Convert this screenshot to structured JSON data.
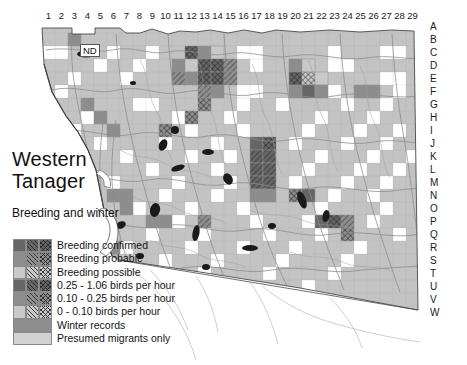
{
  "map": {
    "title_line1": "Western",
    "title_line2": "Tanager",
    "subtitle": "Breeding and winter",
    "nd_label": "ND",
    "region": "San Diego County atlas grid",
    "colors": {
      "land": "#c3c3c3",
      "ocean": "#ffffff",
      "border": "#555555",
      "road": "#9a9a9a",
      "water": "#111111",
      "grid": "#9e9e9e",
      "dark": "#666666",
      "mid": "#8e8e8e",
      "light": "#c9c9c9",
      "white": "#ffffff"
    },
    "columns": [
      "1",
      "2",
      "3",
      "4",
      "5",
      "6",
      "7",
      "8",
      "9",
      "10",
      "11",
      "12",
      "13",
      "14",
      "15",
      "16",
      "17",
      "18",
      "19",
      "20",
      "21",
      "22",
      "23",
      "24",
      "25",
      "26",
      "27",
      "28",
      "29"
    ],
    "rows": [
      "A",
      "B",
      "C",
      "D",
      "E",
      "F",
      "G",
      "H",
      "I",
      "J",
      "K",
      "L",
      "M",
      "N",
      "O",
      "P",
      "Q",
      "R",
      "S",
      "T",
      "U",
      "V",
      "W"
    ]
  },
  "legend": {
    "items": [
      {
        "label": "Breeding confirmed",
        "tone": "t-dark",
        "hatch": "h-none",
        "kind": "matrix"
      },
      {
        "label": "Breeding probable",
        "tone": "t-mid",
        "hatch": "h-diag",
        "kind": "matrix"
      },
      {
        "label": "Breeding possible",
        "tone": "t-light",
        "hatch": "h-cross",
        "kind": "matrix"
      },
      {
        "label": "0.25 - 1.06 birds per hour",
        "tone": "t-dark",
        "hatch": "h-cross",
        "kind": "matrix"
      },
      {
        "label": "0.10 - 0.25 birds per hour",
        "tone": "t-mid",
        "hatch": "h-diag",
        "kind": "matrix"
      },
      {
        "label": "0 - 0.10 birds per hour",
        "tone": "t-light",
        "hatch": "h-none",
        "kind": "matrix"
      },
      {
        "label": "Winter records",
        "tone": "t-winter",
        "hatch": "h-none",
        "kind": "wide"
      },
      {
        "label": "Presumed migrants only",
        "tone": "t-migr",
        "hatch": "h-none",
        "kind": "wide"
      }
    ]
  },
  "chart_data": {
    "type": "heatmap",
    "xlabel": "Atlas column",
    "ylabel": "Atlas row",
    "categories_x": [
      "1",
      "2",
      "3",
      "4",
      "5",
      "6",
      "7",
      "8",
      "9",
      "10",
      "11",
      "12",
      "13",
      "14",
      "15",
      "16",
      "17",
      "18",
      "19",
      "20",
      "21",
      "22",
      "23",
      "24",
      "25",
      "26",
      "27",
      "28",
      "29"
    ],
    "categories_y": [
      "A",
      "B",
      "C",
      "D",
      "E",
      "F",
      "G",
      "H",
      "I",
      "J",
      "K",
      "L",
      "M",
      "N",
      "O",
      "P",
      "Q",
      "R",
      "S",
      "T",
      "U",
      "V",
      "W"
    ],
    "cells": [
      {
        "c": 3,
        "r": "B",
        "tone": "t-mid",
        "hatch": "h-none"
      },
      {
        "c": 12,
        "r": "C",
        "tone": "t-dark",
        "hatch": "h-cross"
      },
      {
        "c": 13,
        "r": "C",
        "tone": "t-mid",
        "hatch": "h-none"
      },
      {
        "c": 14,
        "r": "C",
        "tone": "t-light",
        "hatch": "h-none"
      },
      {
        "c": 11,
        "r": "D",
        "tone": "t-mid",
        "hatch": "h-none"
      },
      {
        "c": 12,
        "r": "D",
        "tone": "t-light",
        "hatch": "h-none"
      },
      {
        "c": 13,
        "r": "D",
        "tone": "t-dark",
        "hatch": "h-cross"
      },
      {
        "c": 14,
        "r": "D",
        "tone": "t-dark",
        "hatch": "h-cross"
      },
      {
        "c": 15,
        "r": "D",
        "tone": "t-mid",
        "hatch": "h-diag"
      },
      {
        "c": 11,
        "r": "E",
        "tone": "t-mid",
        "hatch": "h-diag"
      },
      {
        "c": 12,
        "r": "E",
        "tone": "t-mid",
        "hatch": "h-none"
      },
      {
        "c": 13,
        "r": "E",
        "tone": "t-dark",
        "hatch": "h-cross"
      },
      {
        "c": 14,
        "r": "E",
        "tone": "t-dark",
        "hatch": "h-cross"
      },
      {
        "c": 15,
        "r": "E",
        "tone": "t-mid",
        "hatch": "h-diag"
      },
      {
        "c": 20,
        "r": "D",
        "tone": "t-mid",
        "hatch": "h-none"
      },
      {
        "c": 21,
        "r": "D",
        "tone": "t-light",
        "hatch": "h-none"
      },
      {
        "c": 20,
        "r": "E",
        "tone": "t-dark",
        "hatch": "h-cross"
      },
      {
        "c": 21,
        "r": "E",
        "tone": "t-light",
        "hatch": "h-cross"
      },
      {
        "c": 22,
        "r": "E",
        "tone": "t-light",
        "hatch": "h-none"
      },
      {
        "c": 20,
        "r": "F",
        "tone": "t-mid",
        "hatch": "h-none"
      },
      {
        "c": 21,
        "r": "F",
        "tone": "t-dark",
        "hatch": "h-none"
      },
      {
        "c": 22,
        "r": "F",
        "tone": "t-mid",
        "hatch": "h-none"
      },
      {
        "c": 25,
        "r": "F",
        "tone": "t-mid",
        "hatch": "h-none"
      },
      {
        "c": 26,
        "r": "F",
        "tone": "t-mid",
        "hatch": "h-none"
      },
      {
        "c": 13,
        "r": "F",
        "tone": "t-mid",
        "hatch": "h-diag"
      },
      {
        "c": 14,
        "r": "F",
        "tone": "t-mid",
        "hatch": "h-none"
      },
      {
        "c": 13,
        "r": "G",
        "tone": "t-mid",
        "hatch": "h-cross"
      },
      {
        "c": 12,
        "r": "H",
        "tone": "t-mid",
        "hatch": "h-cross"
      },
      {
        "c": 4,
        "r": "G",
        "tone": "t-mid",
        "hatch": "h-none"
      },
      {
        "c": 5,
        "r": "H",
        "tone": "t-mid",
        "hatch": "h-none"
      },
      {
        "c": 6,
        "r": "I",
        "tone": "t-mid",
        "hatch": "h-none"
      },
      {
        "c": 10,
        "r": "I",
        "tone": "t-mid",
        "hatch": "h-cross"
      },
      {
        "c": 17,
        "r": "J",
        "tone": "t-dark",
        "hatch": "h-none"
      },
      {
        "c": 18,
        "r": "J",
        "tone": "t-dark",
        "hatch": "h-cross"
      },
      {
        "c": 17,
        "r": "K",
        "tone": "t-dark",
        "hatch": "h-diag"
      },
      {
        "c": 18,
        "r": "K",
        "tone": "t-dark",
        "hatch": "h-diag"
      },
      {
        "c": 17,
        "r": "L",
        "tone": "t-dark",
        "hatch": "h-diag"
      },
      {
        "c": 18,
        "r": "L",
        "tone": "t-dark",
        "hatch": "h-diag"
      },
      {
        "c": 17,
        "r": "M",
        "tone": "t-dark",
        "hatch": "h-diag"
      },
      {
        "c": 18,
        "r": "M",
        "tone": "t-dark",
        "hatch": "h-diag"
      },
      {
        "c": 17,
        "r": "N",
        "tone": "t-mid",
        "hatch": "h-none"
      },
      {
        "c": 18,
        "r": "N",
        "tone": "t-mid",
        "hatch": "h-none"
      },
      {
        "c": 20,
        "r": "N",
        "tone": "t-mid",
        "hatch": "h-cross"
      },
      {
        "c": 21,
        "r": "N",
        "tone": "t-dark",
        "hatch": "h-none"
      },
      {
        "c": 1,
        "r": "K",
        "tone": "t-mid",
        "hatch": "h-none"
      },
      {
        "c": 2,
        "r": "K",
        "tone": "t-mid",
        "hatch": "h-none"
      },
      {
        "c": 6,
        "r": "N",
        "tone": "t-mid",
        "hatch": "h-none"
      },
      {
        "c": 7,
        "r": "N",
        "tone": "t-mid",
        "hatch": "h-none"
      },
      {
        "c": 7,
        "r": "O",
        "tone": "t-mid",
        "hatch": "h-none"
      },
      {
        "c": 6,
        "r": "R",
        "tone": "t-mid",
        "hatch": "h-none"
      },
      {
        "c": 9,
        "r": "P",
        "tone": "t-mid",
        "hatch": "h-none"
      },
      {
        "c": 10,
        "r": "P",
        "tone": "t-mid",
        "hatch": "h-none"
      },
      {
        "c": 13,
        "r": "P",
        "tone": "t-mid",
        "hatch": "h-diag"
      },
      {
        "c": 22,
        "r": "P",
        "tone": "t-dark",
        "hatch": "h-none"
      },
      {
        "c": 23,
        "r": "P",
        "tone": "t-dark",
        "hatch": "h-cross"
      },
      {
        "c": 24,
        "r": "P",
        "tone": "t-mid",
        "hatch": "h-diag"
      },
      {
        "c": 24,
        "r": "Q",
        "tone": "t-mid",
        "hatch": "h-cross"
      },
      {
        "c": 9,
        "r": "T",
        "tone": "t-mid",
        "hatch": "h-diag"
      },
      {
        "c": 9,
        "r": "U",
        "tone": "t-mid",
        "hatch": "h-diag"
      },
      {
        "c": 15,
        "r": "U",
        "tone": "t-light",
        "hatch": "h-none"
      }
    ],
    "legend_entries": [
      "Breeding confirmed",
      "Breeding probable",
      "Breeding possible",
      "0.25 - 1.06 birds per hour",
      "0.10 - 0.25 birds per hour",
      "0 - 0.10 birds per hour",
      "Winter records",
      "Presumed migrants only"
    ],
    "legend_position": "lower-left",
    "grid": true
  }
}
